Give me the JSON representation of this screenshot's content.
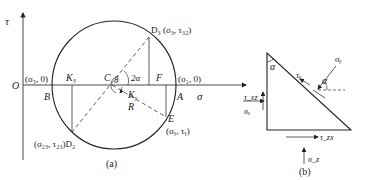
{
  "figure_a": {
    "caption": "(a)",
    "axis_tau": "τ",
    "axis_sigma": "σ",
    "origin": "O",
    "point_B": "B",
    "point_A": "A",
    "point_C": "C",
    "point_F": "F",
    "point_E": "E",
    "point_K3": "K",
    "point_K3_sub": "3",
    "point_Ky": "K",
    "point_Ky_sub": "y",
    "label_R": "R",
    "angle_theta": "θ",
    "angle_2alpha": "2α",
    "label_sigma3_0": "(σ₃, 0)",
    "label_sigma1_0": "(σ₁, 0)",
    "label_D3": "D₃ (σ₃, τ₃₂)",
    "label_D2": "(σ₂₃, τ₂₃)D₂",
    "label_E": "(σᵧ, τᵧ)"
  },
  "figure_b": {
    "caption": "(b)",
    "alpha_top": "α",
    "alpha_right": "α",
    "tau_y": "τᵧ",
    "sigma_y": "σᵧ",
    "tau_xz": "τ_xz",
    "sigma_x": "σₓ",
    "tau_zx": "τ_zx",
    "sigma_z": "σ_z"
  }
}
